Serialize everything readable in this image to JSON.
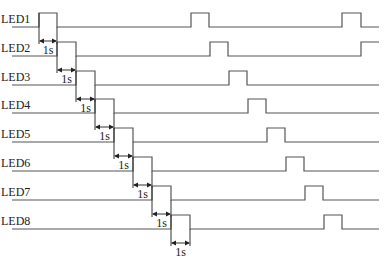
{
  "diagram": {
    "type": "timing-diagram",
    "signals": [
      {
        "label": "LED1",
        "baseline_y": 27,
        "pulses": [
          [
            39,
            57
          ],
          [
            191,
            209
          ],
          [
            342,
            361
          ]
        ],
        "line_end": 379
      },
      {
        "label": "LED2",
        "baseline_y": 56,
        "pulses": [
          [
            57,
            76
          ],
          [
            210,
            228
          ],
          [
            361,
            379
          ]
        ],
        "line_end": 379
      },
      {
        "label": "LED3",
        "baseline_y": 85,
        "pulses": [
          [
            76,
            95
          ],
          [
            229,
            247
          ]
        ],
        "line_end": 379
      },
      {
        "label": "LED4",
        "baseline_y": 113,
        "pulses": [
          [
            95,
            114
          ],
          [
            248,
            266
          ]
        ],
        "line_end": 379
      },
      {
        "label": "LED5",
        "baseline_y": 142,
        "pulses": [
          [
            114,
            133
          ],
          [
            267,
            285
          ]
        ],
        "line_end": 379
      },
      {
        "label": "LED6",
        "baseline_y": 171,
        "pulses": [
          [
            133,
            152
          ],
          [
            286,
            304
          ]
        ],
        "line_end": 379
      },
      {
        "label": "LED7",
        "baseline_y": 200,
        "pulses": [
          [
            152,
            171
          ],
          [
            305,
            323
          ]
        ],
        "line_end": 379
      },
      {
        "label": "LED8",
        "baseline_y": 229,
        "pulses": [
          [
            171,
            190
          ],
          [
            324,
            342
          ]
        ],
        "line_end": 379
      }
    ],
    "pulse_height": 14,
    "duration_label": "1s",
    "line_start_x": 12
  }
}
